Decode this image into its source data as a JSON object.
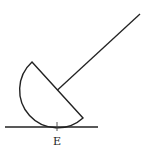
{
  "diagram": {
    "type": "physics-figure",
    "labels": {
      "contact_point": "E"
    },
    "colors": {
      "stroke": "#222222",
      "background": "#ffffff"
    }
  }
}
